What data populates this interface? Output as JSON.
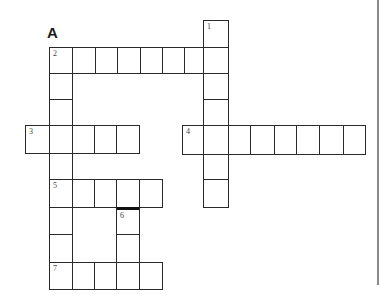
{
  "puzzle": {
    "label": "A",
    "clue_numbers": [
      "1",
      "2",
      "3",
      "4",
      "5",
      "6",
      "7"
    ]
  },
  "cells": [
    {
      "x": 203,
      "y": 20,
      "w": 25,
      "h": 27,
      "num": "1"
    },
    {
      "x": 49,
      "y": 47,
      "w": 23,
      "h": 26,
      "num": "2"
    },
    {
      "x": 72,
      "y": 47,
      "w": 23,
      "h": 26
    },
    {
      "x": 95,
      "y": 47,
      "w": 22,
      "h": 26
    },
    {
      "x": 117,
      "y": 47,
      "w": 23,
      "h": 26
    },
    {
      "x": 140,
      "y": 47,
      "w": 22,
      "h": 26
    },
    {
      "x": 162,
      "y": 47,
      "w": 22,
      "h": 26
    },
    {
      "x": 184,
      "y": 47,
      "w": 19,
      "h": 26
    },
    {
      "x": 203,
      "y": 47,
      "w": 25,
      "h": 26
    },
    {
      "x": 49,
      "y": 73,
      "w": 23,
      "h": 26
    },
    {
      "x": 203,
      "y": 73,
      "w": 25,
      "h": 26
    },
    {
      "x": 49,
      "y": 99,
      "w": 23,
      "h": 26
    },
    {
      "x": 203,
      "y": 99,
      "w": 25,
      "h": 26
    },
    {
      "x": 25,
      "y": 125,
      "w": 24,
      "h": 28,
      "num": "3"
    },
    {
      "x": 49,
      "y": 125,
      "w": 23,
      "h": 28
    },
    {
      "x": 72,
      "y": 125,
      "w": 22,
      "h": 28
    },
    {
      "x": 94,
      "y": 125,
      "w": 22,
      "h": 28
    },
    {
      "x": 116,
      "y": 125,
      "w": 23,
      "h": 28
    },
    {
      "x": 182,
      "y": 125,
      "w": 21,
      "h": 29,
      "num": "4"
    },
    {
      "x": 203,
      "y": 125,
      "w": 25,
      "h": 29
    },
    {
      "x": 228,
      "y": 125,
      "w": 22,
      "h": 29
    },
    {
      "x": 250,
      "y": 125,
      "w": 24,
      "h": 29
    },
    {
      "x": 274,
      "y": 125,
      "w": 22,
      "h": 29
    },
    {
      "x": 296,
      "y": 125,
      "w": 23,
      "h": 29
    },
    {
      "x": 319,
      "y": 125,
      "w": 24,
      "h": 29
    },
    {
      "x": 343,
      "y": 125,
      "w": 22,
      "h": 29
    },
    {
      "x": 49,
      "y": 153,
      "w": 23,
      "h": 26
    },
    {
      "x": 203,
      "y": 154,
      "w": 25,
      "h": 25
    },
    {
      "x": 203,
      "y": 179,
      "w": 25,
      "h": 28
    },
    {
      "x": 49,
      "y": 179,
      "w": 23,
      "h": 28,
      "num": "5"
    },
    {
      "x": 72,
      "y": 179,
      "w": 22,
      "h": 28
    },
    {
      "x": 94,
      "y": 179,
      "w": 22,
      "h": 28
    },
    {
      "x": 116,
      "y": 179,
      "w": 23,
      "h": 28
    },
    {
      "x": 139,
      "y": 179,
      "w": 23,
      "h": 28
    },
    {
      "x": 49,
      "y": 207,
      "w": 23,
      "h": 27
    },
    {
      "x": 116,
      "y": 207,
      "w": 23,
      "h": 27,
      "num": "6",
      "thick_top": true
    },
    {
      "x": 49,
      "y": 234,
      "w": 23,
      "h": 28
    },
    {
      "x": 116,
      "y": 234,
      "w": 23,
      "h": 28
    },
    {
      "x": 49,
      "y": 262,
      "w": 23,
      "h": 27,
      "num": "7"
    },
    {
      "x": 72,
      "y": 262,
      "w": 22,
      "h": 27
    },
    {
      "x": 94,
      "y": 262,
      "w": 22,
      "h": 27
    },
    {
      "x": 116,
      "y": 262,
      "w": 23,
      "h": 27
    },
    {
      "x": 139,
      "y": 262,
      "w": 23,
      "h": 27
    }
  ]
}
